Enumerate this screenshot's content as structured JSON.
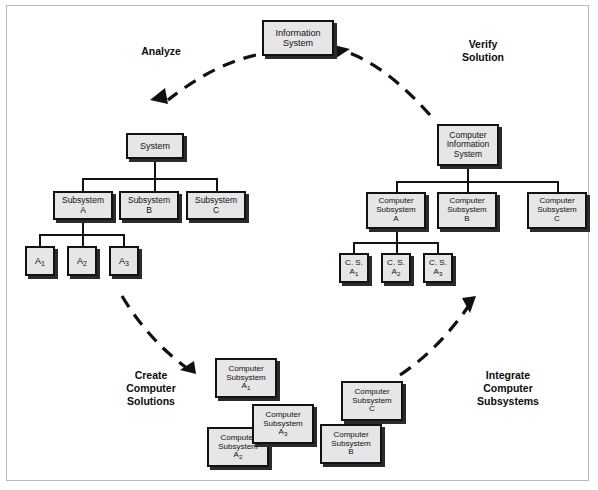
{
  "diagram": {
    "frame": {
      "border_color": "#b9b9b9",
      "background": "#ffffff"
    },
    "box_style": {
      "fill": "#e6e6e6",
      "stroke": "#121212",
      "shadow": "#2b2b2b"
    },
    "arrow_style": {
      "color": "#111111",
      "dashed": true
    }
  },
  "top": {
    "information_system": "Information\nSystem"
  },
  "labels": {
    "analyze": "Analyze",
    "verify_solution": "Verify\nSolution",
    "create_computer_solutions": "Create\nComputer\nSolutions",
    "integrate_computer_subsystems": "Integrate\nComputer\nSubsystems"
  },
  "left_tree": {
    "root": "System",
    "level2": [
      "Subsystem\nA",
      "Subsystem\nB",
      "Subsystem\nC"
    ],
    "level3": [
      {
        "base": "A",
        "sub": "1"
      },
      {
        "base": "A",
        "sub": "2"
      },
      {
        "base": "A",
        "sub": "3"
      }
    ]
  },
  "right_tree": {
    "root": "Computer\nInformation\nSystem",
    "level2": [
      "Computer\nSubsystem\nA",
      "Computer\nSubsystem\nB",
      "Computer\nSubsystem\nC"
    ],
    "level3": [
      {
        "base": "C. S.\nA",
        "sub": "1"
      },
      {
        "base": "C. S.\nA",
        "sub": "2"
      },
      {
        "base": "C. S.\nA",
        "sub": "3"
      }
    ]
  },
  "bottom_scattered": [
    {
      "name": "computer-subsystem-a1",
      "base": "Computer\nSubsystem\nA",
      "sub": "1"
    },
    {
      "name": "computer-subsystem-a3",
      "base": "Computer\nSubsystem\nA",
      "sub": "3"
    },
    {
      "name": "computer-subsystem-a2",
      "base": "Computer\nSubsystem\nA",
      "sub": "2"
    },
    {
      "name": "computer-subsystem-c",
      "base": "Computer\nSubsystem\nC",
      "sub": ""
    },
    {
      "name": "computer-subsystem-b",
      "base": "Computer\nSubsystem\nB",
      "sub": ""
    }
  ]
}
